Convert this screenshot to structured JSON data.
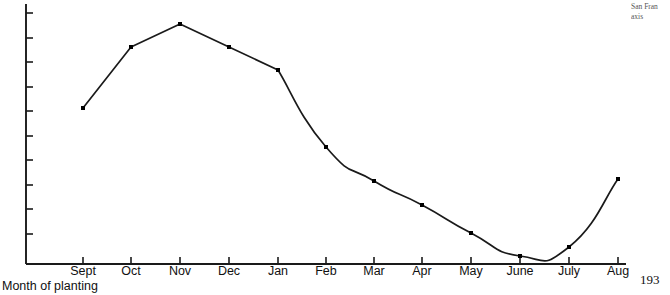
{
  "page": {
    "number": "193",
    "corner_note_line1": "San Fran",
    "corner_note_line2": "axis"
  },
  "axis_title": {
    "x": "Month of planting"
  },
  "colors": {
    "line": "#1a1a1a",
    "axis": "#1a1a1a",
    "marker": "#000000",
    "background": "#ffffff"
  },
  "chart_data": {
    "type": "line",
    "title": "",
    "subtitle": "",
    "xlabel": "Month of planting",
    "ylabel": "",
    "grid": false,
    "legend": null,
    "smooth": true,
    "markers": true,
    "categories": [
      "Sept",
      "Oct",
      "Nov",
      "Dec",
      "Jan",
      "Feb",
      "Mar",
      "Apr",
      "May",
      "June",
      "July",
      "Aug"
    ],
    "x_tick_labels": [
      "Sept",
      "Oct",
      "Nov",
      "Dec",
      "Jan",
      "Feb",
      "Mar",
      "Apr",
      "May",
      "June",
      "July",
      "Aug"
    ],
    "y_tick_labels": [],
    "y_tick_count": 10,
    "ylim": [
      0,
      100
    ],
    "xlim": [
      0,
      11
    ],
    "series": [
      {
        "name": "",
        "values": [
          62,
          86,
          96,
          86,
          78,
          47,
          34,
          24,
          12,
          4,
          8,
          34
        ]
      }
    ],
    "values": [
      62,
      86,
      96,
      86,
      78,
      47,
      34,
      24,
      12,
      4,
      8,
      34
    ],
    "annotations": []
  },
  "geometry": {
    "plot_left": 26,
    "plot_right": 626,
    "plot_top": 4,
    "plot_bottom": 264,
    "x_tick_px": [
      83,
      131,
      180,
      229,
      278,
      326,
      374,
      422,
      471,
      520,
      569,
      618
    ],
    "y_tick_px": [
      13,
      38,
      62,
      87,
      111,
      136,
      160,
      185,
      209,
      234
    ],
    "point_px": [
      [
        83,
        108
      ],
      [
        131,
        47
      ],
      [
        180,
        24
      ],
      [
        229,
        47
      ],
      [
        278,
        70
      ],
      [
        326,
        147
      ],
      [
        374,
        181
      ],
      [
        422,
        205
      ],
      [
        471,
        233
      ],
      [
        520,
        256
      ],
      [
        569,
        247
      ],
      [
        618,
        179
      ]
    ]
  }
}
